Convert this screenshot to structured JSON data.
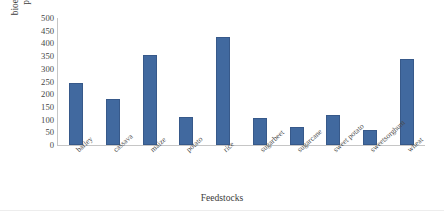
{
  "chart_data": {
    "type": "bar",
    "title": "",
    "xlabel": "Feedstocks",
    "ylabel_lines": [
      "bioethanol production",
      "potential (L/ton)"
    ],
    "ylabel": "bioethanol production potential (L/ton)",
    "categories": [
      "barley",
      "cassava",
      "maize",
      "potato",
      "rice",
      "sugarbeet",
      "sugarcane",
      "sweet potato",
      "sweetsorghum",
      "wheat"
    ],
    "values": [
      245,
      180,
      355,
      110,
      425,
      105,
      70,
      120,
      58,
      340
    ],
    "ylim": [
      0,
      500
    ],
    "ytick_labels": [
      "500",
      "450",
      "400",
      "350",
      "300",
      "250",
      "200",
      "150",
      "100",
      "50",
      "0"
    ],
    "ytick_values": [
      500,
      450,
      400,
      350,
      300,
      250,
      200,
      150,
      100,
      50,
      0
    ],
    "grid": false,
    "legend": "none",
    "series_color": "#41699f",
    "axis_color": "#c6c6c6",
    "text_color": "#3f3f3f"
  }
}
